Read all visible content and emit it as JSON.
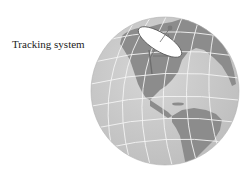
{
  "figure": {
    "label": "Tracking system",
    "colors": {
      "background": "#ffffff",
      "ocean": "#c9c9c9",
      "land": "#8c8c8c",
      "grid": "#f4f4f4",
      "dish": "#ffffff",
      "dish_outline": "#555555",
      "mount": "#6e6e6e",
      "text": "#222222"
    },
    "globe": {
      "cx": 165,
      "cy": 91,
      "r": 74
    },
    "elements": [
      "globe",
      "latitude-longitude-grid",
      "continents-north-south-america",
      "satellite-dish"
    ]
  }
}
